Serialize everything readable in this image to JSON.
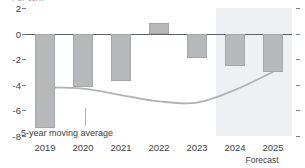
{
  "clipped_title": "Per cent",
  "chart_data": {
    "type": "bar",
    "title": "Per cent",
    "xlabel": "",
    "ylabel": "",
    "categories": [
      "2019",
      "2020",
      "2021",
      "2022",
      "2023",
      "2024",
      "2025"
    ],
    "values": [
      -7.4,
      -4.2,
      -3.7,
      0.8,
      -1.9,
      -2.5,
      -3.0
    ],
    "ylim": [
      -8,
      2
    ],
    "yticks": [
      2,
      0,
      -2,
      -4,
      -6,
      -8
    ],
    "ytick_labels": [
      "2",
      "0",
      "-2",
      "-4",
      "-6",
      "-8"
    ],
    "grid": false,
    "zero_line": true,
    "legend": "none",
    "series": [
      {
        "name": "Annual value",
        "type": "bar",
        "values": [
          -7.4,
          -4.2,
          -3.7,
          0.8,
          -1.9,
          -2.5,
          -3.0
        ]
      },
      {
        "name": "5-year moving average",
        "type": "line",
        "x": [
          "2019",
          "2020",
          "2021",
          "2022",
          "2023",
          "2024",
          "2025"
        ],
        "values": [
          -4.2,
          -4.3,
          -4.8,
          -5.3,
          -5.4,
          -4.4,
          -3.0
        ]
      }
    ],
    "annotations": [
      {
        "text": "5-year moving average",
        "target_series": "5-year moving average",
        "target_x": "2020"
      },
      {
        "text": "Forecast",
        "covers": [
          "2024",
          "2025"
        ]
      }
    ],
    "shaded_regions": [
      {
        "label": "Forecast",
        "from": "2024",
        "to": "2025"
      }
    ],
    "colors": {
      "bar_fill": "#b6b8ba",
      "bar_stroke": "#a4a6a8",
      "line": "#b0b3b6",
      "zero_line": "#5f6368",
      "forecast_band": "#eef0f1",
      "text": "#3c4043"
    }
  },
  "axis": {
    "y_labels": [
      "2",
      "0",
      "-2",
      "-4",
      "-6",
      "-8"
    ],
    "x_labels": [
      "2019",
      "2020",
      "2021",
      "2022",
      "2023",
      "2024",
      "2025"
    ]
  },
  "labels": {
    "moving_average": "5-year moving average",
    "forecast": "Forecast"
  }
}
